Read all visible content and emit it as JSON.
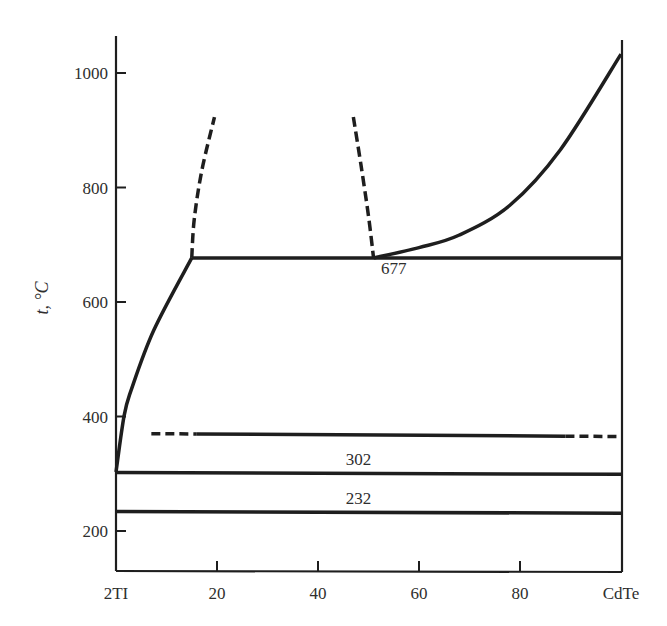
{
  "chart_data": {
    "type": "line",
    "title": "",
    "xlabel": "",
    "ylabel": "t, °C",
    "xlim": [
      0,
      100
    ],
    "ylim": [
      135,
      1065
    ],
    "grid": false,
    "legend": null,
    "x_ticks": [
      {
        "value": 0,
        "label": "2TI"
      },
      {
        "value": 20,
        "label": "20"
      },
      {
        "value": 40,
        "label": "40"
      },
      {
        "value": 60,
        "label": "60"
      },
      {
        "value": 80,
        "label": "80"
      },
      {
        "value": 100,
        "label": "CdTe"
      }
    ],
    "y_ticks": [
      {
        "value": 200,
        "label": "200"
      },
      {
        "value": 400,
        "label": "400"
      },
      {
        "value": 600,
        "label": "600"
      },
      {
        "value": 800,
        "label": "800"
      },
      {
        "value": 1000,
        "label": "1000"
      }
    ],
    "series": [
      {
        "name": "liquidus-left",
        "style": "solid",
        "points": [
          [
            0,
            303
          ],
          [
            1.6,
            401
          ],
          [
            3,
            446
          ],
          [
            7.5,
            551
          ],
          [
            15,
            677
          ]
        ]
      },
      {
        "name": "miscibility-gap-left",
        "style": "dashed",
        "points": [
          [
            15,
            677
          ],
          [
            15.5,
            745
          ],
          [
            17,
            830
          ],
          [
            19.5,
            923
          ]
        ]
      },
      {
        "name": "miscibility-gap-right",
        "style": "dashed",
        "points": [
          [
            47,
            923
          ],
          [
            48.5,
            840
          ],
          [
            50,
            750
          ],
          [
            51,
            677
          ]
        ]
      },
      {
        "name": "liquidus-right",
        "style": "solid",
        "points": [
          [
            51,
            677
          ],
          [
            60,
            695
          ],
          [
            68,
            717
          ],
          [
            78,
            769
          ],
          [
            88,
            866
          ],
          [
            100,
            1033
          ]
        ]
      },
      {
        "name": "monotectic-677",
        "style": "solid",
        "points": [
          [
            15,
            677
          ],
          [
            100,
            677
          ]
        ]
      },
      {
        "name": "transition-370",
        "style": "dash-solid-dash",
        "points": [
          [
            7,
            370
          ],
          [
            100,
            365
          ]
        ],
        "solid_range": [
          16,
          89
        ]
      },
      {
        "name": "eutectic-302",
        "style": "solid",
        "points": [
          [
            0,
            302
          ],
          [
            100,
            299
          ]
        ]
      },
      {
        "name": "eutectic-232",
        "style": "solid",
        "points": [
          [
            0,
            234
          ],
          [
            100,
            231
          ]
        ]
      }
    ],
    "annotations": [
      {
        "text": "677",
        "x": 55,
        "y": 660
      },
      {
        "text": "302",
        "x": 48,
        "y": 326
      },
      {
        "text": "232",
        "x": 48,
        "y": 258
      }
    ]
  }
}
